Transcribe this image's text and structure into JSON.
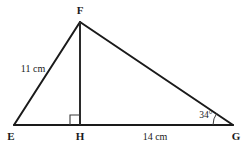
{
  "figure": {
    "type": "geometry-diagram",
    "shape": "triangle-with-altitude",
    "background_color": "#ffffff",
    "stroke_color": "#1a1a1a",
    "text_color": "#1a1a1a",
    "vertices": [
      {
        "name": "E",
        "label": "E",
        "x": 14,
        "y": 125
      },
      {
        "name": "F",
        "label": "F",
        "x": 80,
        "y": 22
      },
      {
        "name": "G",
        "label": "G",
        "x": 233,
        "y": 125
      },
      {
        "name": "H",
        "label": "H",
        "x": 80,
        "y": 125
      }
    ],
    "segments": [
      {
        "name": "side-EF",
        "from": "E",
        "to": "F"
      },
      {
        "name": "side-FG",
        "from": "F",
        "to": "G"
      },
      {
        "name": "side-EG",
        "from": "E",
        "to": "G"
      },
      {
        "name": "altitude-FH",
        "from": "F",
        "to": "H"
      }
    ],
    "measurements": [
      {
        "name": "length-EF",
        "value": "11 cm",
        "segment": "EF"
      },
      {
        "name": "length-HG",
        "value": "14 cm",
        "segment": "HG"
      },
      {
        "name": "angle-G",
        "value": "34°",
        "vertex": "G"
      }
    ],
    "markers": [
      {
        "name": "right-angle-at-H",
        "type": "square",
        "vertex": "H",
        "value": "90°"
      }
    ]
  }
}
